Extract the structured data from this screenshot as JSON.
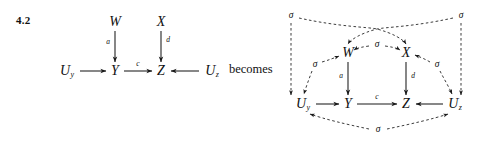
{
  "exercise": {
    "number": "4.2"
  },
  "connector": {
    "text": "becomes"
  },
  "left_diagram": {
    "name": "original-causal-graph",
    "nodes": [
      {
        "id": "W",
        "label": "W",
        "x": 115,
        "y": 22
      },
      {
        "id": "X",
        "label": "X",
        "x": 161,
        "y": 22
      },
      {
        "id": "Uy",
        "label": "U",
        "sub": "y",
        "x": 67,
        "y": 71
      },
      {
        "id": "Y",
        "label": "Y",
        "x": 115,
        "y": 71
      },
      {
        "id": "Z",
        "label": "Z",
        "x": 161,
        "y": 71
      },
      {
        "id": "Uz",
        "label": "U",
        "sub": "z",
        "x": 212,
        "y": 71
      }
    ],
    "edges": [
      {
        "from": "W",
        "to": "Y",
        "label": "a",
        "label_side": "left"
      },
      {
        "from": "X",
        "to": "Z",
        "label": "d",
        "label_side": "right"
      },
      {
        "from": "Uy",
        "to": "Y",
        "label": "",
        "label_side": "above"
      },
      {
        "from": "Y",
        "to": "Z",
        "label": "c",
        "label_side": "above"
      },
      {
        "from": "Uz",
        "to": "Z",
        "label": "",
        "label_side": "above"
      }
    ]
  },
  "right_diagram": {
    "name": "graph-with-confounders",
    "nodes": [
      {
        "id": "W",
        "label": "W",
        "x": 348,
        "y": 53
      },
      {
        "id": "X",
        "label": "X",
        "x": 406,
        "y": 53
      },
      {
        "id": "Uy",
        "label": "U",
        "sub": "y",
        "x": 303,
        "y": 104
      },
      {
        "id": "Y",
        "label": "Y",
        "x": 348,
        "y": 104
      },
      {
        "id": "Z",
        "label": "Z",
        "x": 406,
        "y": 104
      },
      {
        "id": "Uz",
        "label": "U",
        "sub": "z",
        "x": 455,
        "y": 104
      }
    ],
    "edges": [
      {
        "from": "W",
        "to": "Y",
        "label": "a",
        "label_side": "left"
      },
      {
        "from": "X",
        "to": "Z",
        "label": "d",
        "label_side": "right"
      },
      {
        "from": "Uy",
        "to": "Y",
        "label": "",
        "label_side": "above"
      },
      {
        "from": "Y",
        "to": "Z",
        "label": "c",
        "label_side": "above"
      },
      {
        "from": "Uz",
        "to": "Z",
        "label": "",
        "label_side": "above"
      }
    ],
    "confounders": [
      {
        "id": "sigma-top-left",
        "label": "σ",
        "x": 291,
        "y": 16,
        "targets": [
          "Uy",
          "X"
        ]
      },
      {
        "id": "sigma-top-right",
        "label": "σ",
        "x": 461,
        "y": 16,
        "targets": [
          "Uz",
          "W"
        ]
      },
      {
        "id": "sigma-middle",
        "label": "σ",
        "x": 377,
        "y": 45,
        "targets": [
          "W",
          "X"
        ]
      },
      {
        "id": "sigma-left",
        "label": "σ",
        "x": 315,
        "y": 65,
        "targets": [
          "W",
          "Uy"
        ]
      },
      {
        "id": "sigma-right",
        "label": "σ",
        "x": 437,
        "y": 65,
        "targets": [
          "X",
          "Uz"
        ]
      },
      {
        "id": "sigma-bottom",
        "label": "σ",
        "x": 378,
        "y": 130,
        "targets": [
          "Uy",
          "Uz"
        ]
      }
    ]
  },
  "style": {
    "ink": "#1a1a1a",
    "background": "#ffffff",
    "dash_pattern": "2.6 2.4"
  }
}
